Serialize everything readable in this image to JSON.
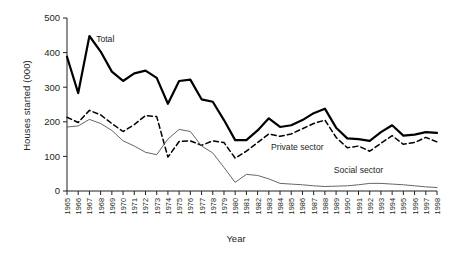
{
  "chart_data": {
    "type": "line",
    "title": "",
    "xlabel": "Year",
    "ylabel": "Houses started (000)",
    "xlim": [
      1965,
      1998
    ],
    "ylim": [
      0,
      500
    ],
    "yticks": [
      0,
      100,
      200,
      300,
      400,
      500
    ],
    "grid": false,
    "legend_position": "inline-annotations",
    "categories": [
      "1965",
      "1966",
      "1967",
      "1968",
      "1969",
      "1970",
      "1971",
      "1972",
      "1973",
      "1974",
      "1975",
      "1976",
      "1977",
      "1978",
      "1979",
      "1980",
      "1981",
      "1982",
      "1983",
      "1984",
      "1985",
      "1986",
      "1987",
      "1988",
      "1989",
      "1990",
      "1991",
      "1992",
      "1993",
      "1994",
      "1995",
      "1996",
      "1997",
      "1998"
    ],
    "series": [
      {
        "name": "Total",
        "style": "solid-thick",
        "color": "#000000",
        "label_x": 1967.6,
        "label_y": 432,
        "values": [
          388,
          283,
          448,
          403,
          345,
          318,
          340,
          348,
          327,
          252,
          318,
          322,
          265,
          258,
          205,
          147,
          147,
          175,
          210,
          185,
          190,
          205,
          225,
          238,
          183,
          152,
          150,
          145,
          170,
          190,
          160,
          163,
          170,
          168
        ]
      },
      {
        "name": "Private sector",
        "style": "dashed",
        "color": "#000000",
        "label_x": 1983.2,
        "label_y": 118,
        "values": [
          213,
          198,
          233,
          220,
          195,
          172,
          192,
          218,
          215,
          98,
          143,
          145,
          132,
          145,
          140,
          95,
          115,
          140,
          165,
          158,
          165,
          180,
          195,
          205,
          155,
          125,
          130,
          115,
          138,
          160,
          135,
          140,
          155,
          142
        ]
      },
      {
        "name": "Social sector",
        "style": "solid-thin",
        "color": "#555555",
        "label_x": 1988.8,
        "label_y": 52,
        "values": [
          185,
          188,
          207,
          195,
          175,
          145,
          130,
          112,
          105,
          150,
          178,
          172,
          130,
          110,
          68,
          25,
          48,
          45,
          35,
          22,
          20,
          18,
          15,
          13,
          14,
          15,
          18,
          22,
          22,
          20,
          18,
          15,
          12,
          10
        ]
      }
    ]
  },
  "axis": {
    "y_title": "Houses started (000)",
    "x_title": "Year"
  }
}
